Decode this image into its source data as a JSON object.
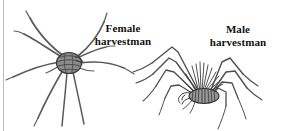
{
  "figure": {
    "type": "scanned-illustration",
    "background_color": "#ffffff",
    "ink_color": "#4a4a4a",
    "dark_ink_color": "#2b2b2b",
    "scan_edge_color": "#b9b9b9",
    "width": 283,
    "height": 131
  },
  "labels": {
    "female": {
      "line1": "Female",
      "line2": "harvestman"
    },
    "male": {
      "line1": "Male",
      "line2": "harvestman"
    }
  },
  "specimens": [
    {
      "id": "female-harvestman",
      "name": "Female harvestman",
      "body_center_x": 69,
      "body_center_y": 62,
      "body_width": 26,
      "body_height": 22,
      "leg_count": 8,
      "leg_style": "long sweeping curved"
    },
    {
      "id": "male-harvestman",
      "name": "Male harvestman",
      "body_center_x": 205,
      "body_center_y": 95,
      "body_width": 30,
      "body_height": 16,
      "leg_count": 8,
      "leg_style": "long angular raised knees"
    }
  ]
}
